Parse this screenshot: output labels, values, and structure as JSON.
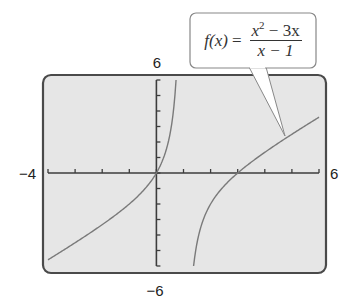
{
  "chart_data": {
    "type": "line",
    "title": "",
    "function_label": "f(x) = (x^2 - 3x)/(x - 1)",
    "xlabel": "",
    "ylabel": "",
    "xlim": [
      -4,
      6
    ],
    "ylim": [
      -6,
      6
    ],
    "x_tick_step": 1,
    "y_tick_step": 1,
    "grid": false,
    "window_labels": {
      "xmin": "−4",
      "xmax": "6",
      "ymin": "−6",
      "ymax": "6"
    },
    "vertical_asymptote": 1,
    "series": [
      {
        "name": "left branch",
        "x": [
          -4,
          -3,
          -2,
          -1,
          -0.5,
          0,
          0.3,
          0.5,
          0.6,
          0.7,
          0.725
        ],
        "y": [
          -5.6,
          -4.5,
          -3.333,
          -2,
          -1.167,
          0,
          1.157,
          2.5,
          3.6,
          5.367,
          6
        ]
      },
      {
        "name": "right branch",
        "x": [
          1.372,
          1.5,
          2,
          2.5,
          3,
          4,
          5,
          6
        ],
        "y": [
          -6,
          -4.5,
          -2,
          -0.833,
          0,
          1.333,
          2.5,
          3.6
        ]
      }
    ]
  },
  "callout": {
    "lhs": "f(x)",
    "equals": "=",
    "num_base": "x",
    "num_exp": "2",
    "num_rest": "− 3x",
    "den": "x − 1"
  },
  "colors": {
    "plot_bg": "#e6e6e6",
    "frame": "#4a4a4a",
    "curve": "#7a7a7a",
    "axis": "#3c3c3c"
  }
}
